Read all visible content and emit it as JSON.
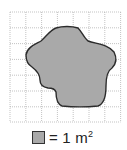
{
  "diagram": {
    "type": "area-on-grid",
    "grid": {
      "columns": 7,
      "rows": 7,
      "cell_px": 15.8,
      "origin": [
        10,
        12
      ]
    },
    "shape": {
      "fill": "#a9a9a9",
      "stroke": "#2b2b2b"
    },
    "grid_color": "#9a9a9a"
  },
  "legend": {
    "equals": "= 1 m",
    "superscript": "2",
    "unit_label": "1 m²"
  }
}
